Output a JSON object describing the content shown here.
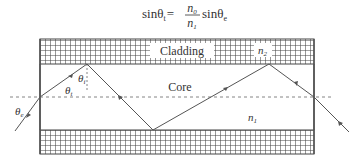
{
  "formula": {
    "lhs": "sinθ",
    "lhs_sub": "t",
    "equals": "=",
    "numerator": "n",
    "numerator_sub": "0",
    "denominator": "n",
    "denominator_sub": "1",
    "rhs": "sinθ",
    "rhs_sub": "e"
  },
  "diagram": {
    "labels": {
      "cladding": "Cladding",
      "core": "Core",
      "n2": "n",
      "n2_sub": "2",
      "n1": "n",
      "n1_sub": "1",
      "theta_i": "θ",
      "theta_i_sub": "i",
      "theta_t": "θ",
      "theta_t_sub": "t",
      "theta_e": "θ",
      "theta_e_sub": "e"
    },
    "colors": {
      "line": "#555555",
      "grid": "#444444",
      "dash": "#777777"
    }
  }
}
